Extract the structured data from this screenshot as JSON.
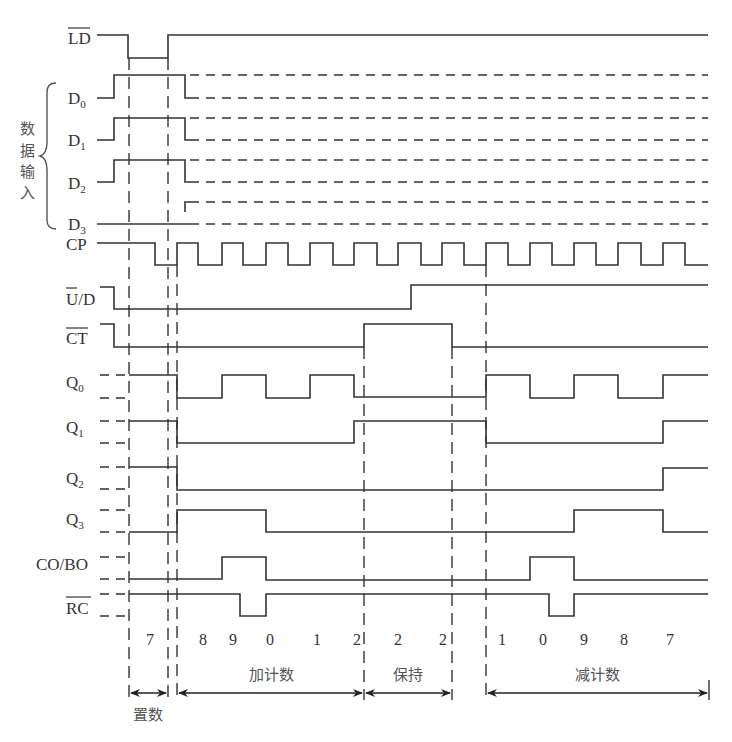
{
  "signals": {
    "ld": "LD",
    "d0": "D",
    "d0_sub": "0",
    "d1": "D",
    "d1_sub": "1",
    "d2": "D",
    "d2_sub": "2",
    "d3": "D",
    "d3_sub": "3",
    "cp": "CP",
    "ud": "U/D",
    "ct": "CT",
    "q0": "Q",
    "q0_sub": "0",
    "q1": "Q",
    "q1_sub": "1",
    "q2": "Q",
    "q2_sub": "2",
    "q3": "Q",
    "q3_sub": "3",
    "cobo": "CO/BO",
    "rc": "RC"
  },
  "group_label": [
    "数",
    "据",
    "输",
    "入"
  ],
  "count_values": [
    "7",
    "8",
    "9",
    "0",
    "1",
    "2",
    "2",
    "2",
    "1",
    "0",
    "9",
    "8",
    "7"
  ],
  "phases": {
    "load": "置数",
    "count_up": "加计数",
    "hold": "保持",
    "count_down": "减计数"
  }
}
